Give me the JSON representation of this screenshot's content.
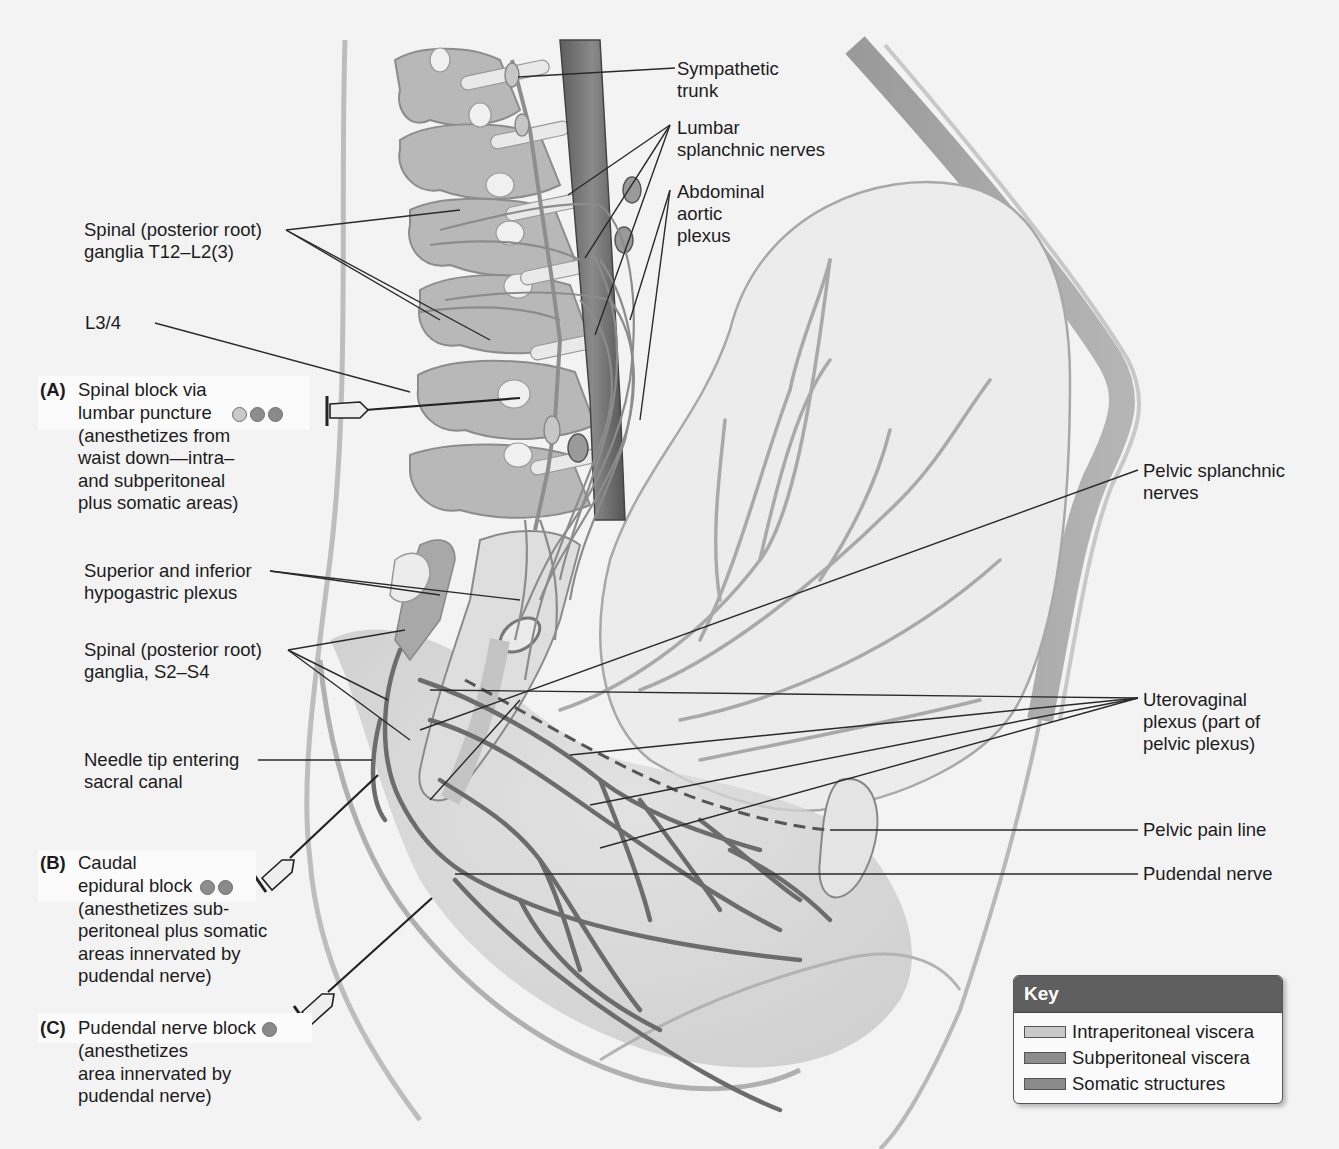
{
  "figure": {
    "colors": {
      "background": "#f3f3f3",
      "intraperitoneal_viscera": "#c9c9c9",
      "subperitoneal_viscera": "#8d8d8d",
      "somatic_structures": "#8a8a8a",
      "key_header": "#5f5f5f"
    }
  },
  "labels": {
    "sympathetic_trunk": [
      "Sympathetic",
      "trunk"
    ],
    "lumbar_splanchnic": [
      "Lumbar",
      "splanchnic nerves"
    ],
    "abdominal_aortic": [
      "Abdominal",
      "aortic",
      "plexus"
    ],
    "spinal_ganglia_t12": [
      "Spinal (posterior root)",
      "ganglia T12–L2(3)"
    ],
    "l3_4": [
      "L3/4"
    ],
    "hypogastric": [
      "Superior and inferior",
      "hypogastric plexus"
    ],
    "spinal_ganglia_s2": [
      "Spinal (posterior root)",
      "ganglia, S2–S4"
    ],
    "needle_tip": [
      "Needle tip entering",
      "sacral canal"
    ],
    "pelvic_splanchnic": [
      "Pelvic splanchnic",
      "nerves"
    ],
    "uterovaginal": [
      "Uterovaginal",
      "plexus (part of",
      "pelvic plexus)"
    ],
    "pelvic_pain_line": [
      "Pelvic pain line"
    ],
    "pudendal_nerve": [
      "Pudendal nerve"
    ]
  },
  "blocks": [
    {
      "letter": "(A)",
      "title_lines": [
        "Spinal block via",
        "lumbar puncture"
      ],
      "desc_lines": [
        "(anesthetizes from",
        "waist down—intra–",
        "and subperitoneal",
        "plus somatic areas)"
      ],
      "dots": [
        "intra",
        "sub",
        "som"
      ]
    },
    {
      "letter": "(B)",
      "title_lines": [
        "Caudal",
        "epidural block"
      ],
      "desc_lines": [
        "(anesthetizes sub-",
        "peritoneal plus somatic",
        "areas innervated by",
        "pudendal nerve)"
      ],
      "dots": [
        "sub",
        "som"
      ]
    },
    {
      "letter": "(C)",
      "title_lines": [
        "Pudendal nerve block"
      ],
      "desc_lines": [
        "(anesthetizes",
        "area innervated by",
        "pudendal nerve)"
      ],
      "dots": [
        "som"
      ]
    }
  ],
  "key": {
    "title": "Key",
    "items": [
      {
        "label": "Intraperitoneal viscera",
        "color": "#c9c9c9"
      },
      {
        "label": "Subperitoneal viscera",
        "color": "#8d8d8d"
      },
      {
        "label": "Somatic structures",
        "color": "#8a8a8a"
      }
    ]
  }
}
